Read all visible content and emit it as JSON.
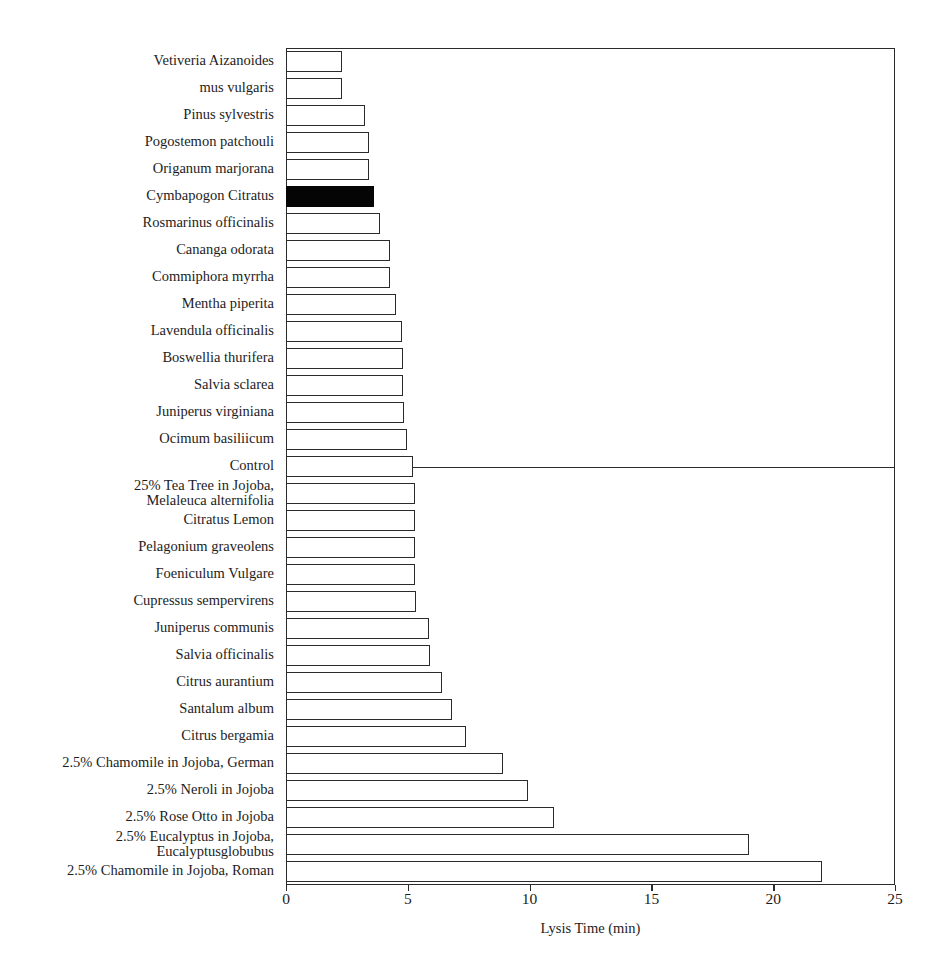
{
  "figure": {
    "top_sliver_text": "",
    "background": "#ffffff",
    "bar_outline_color": "#2b2b2b",
    "bar_fill_color": "#ffffff",
    "highlight_fill_color": "#050505"
  },
  "chart_data": {
    "type": "bar",
    "orientation": "horizontal",
    "title": "",
    "xlabel": "Lysis Time (min)",
    "ylabel": "",
    "xlim": [
      0,
      25
    ],
    "xticks": [
      0,
      5,
      10,
      15,
      20,
      25
    ],
    "xtick_labels": [
      "0",
      "5",
      "10",
      "15",
      "20",
      "25"
    ],
    "grid": false,
    "legend": null,
    "highlight_category": "Cymbapogon Citratus",
    "reference_line": {
      "category": "Control",
      "value": 5.2,
      "description": "horizontal line drawn from the Control bar tip to the right plot edge"
    },
    "categories": [
      "Vetiveria Aizanoides",
      "mus vulgaris",
      "Pinus sylvestris",
      "Pogostemon patchouli",
      "Origanum marjorana",
      "Cymbapogon Citratus",
      "Rosmarinus officinalis",
      "Cananga odorata",
      "Commiphora myrrha",
      "Mentha piperita",
      "Lavendula officinalis",
      "Boswellia thurifera",
      "Salvia sclarea",
      "Juniperus virginiana",
      "Ocimum basiliicum",
      "Control",
      "25% Tea Tree in Jojoba, Melaleuca alternifolia",
      "Citratus Lemon",
      "Pelagonium graveolens",
      "Foeniculum Vulgare",
      "Cupressus sempervirens",
      "Juniperus communis",
      "Salvia officinalis",
      "Citrus aurantium",
      "Santalum album",
      "Citrus bergamia",
      "2.5% Chamomile in Jojoba, German",
      "2.5% Neroli in Jojoba",
      "2.5% Rose Otto in Jojoba",
      "2.5% Eucalyptus in Jojoba, Eucalyptusglobubus",
      "2.5% Chamomile in Jojoba, Roman"
    ],
    "values": [
      2.3,
      2.3,
      3.25,
      3.4,
      3.4,
      3.6,
      3.85,
      4.25,
      4.25,
      4.5,
      4.75,
      4.8,
      4.8,
      4.85,
      4.95,
      5.2,
      5.3,
      5.3,
      5.3,
      5.3,
      5.35,
      5.85,
      5.9,
      6.4,
      6.8,
      7.4,
      8.9,
      9.95,
      11.0,
      19.0,
      22.0
    ]
  },
  "ylabel_lines": [
    [
      "Vetiveria Aizanoides"
    ],
    [
      "mus vulgaris"
    ],
    [
      "Pinus sylvestris"
    ],
    [
      "Pogostemon patchouli"
    ],
    [
      "Origanum marjorana"
    ],
    [
      "Cymbapogon Citratus"
    ],
    [
      "Rosmarinus officinalis"
    ],
    [
      "Cananga odorata"
    ],
    [
      "Commiphora myrrha"
    ],
    [
      "Mentha piperita"
    ],
    [
      "Lavendula officinalis"
    ],
    [
      "Boswellia thurifera"
    ],
    [
      "Salvia sclarea"
    ],
    [
      "Juniperus virginiana"
    ],
    [
      "Ocimum basiliicum"
    ],
    [
      "Control"
    ],
    [
      "25% Tea Tree in Jojoba,",
      "Melaleuca alternifolia"
    ],
    [
      "Citratus Lemon"
    ],
    [
      "Pelagonium graveolens"
    ],
    [
      "Foeniculum Vulgare"
    ],
    [
      "Cupressus sempervirens"
    ],
    [
      "Juniperus communis"
    ],
    [
      "Salvia officinalis"
    ],
    [
      "Citrus aurantium"
    ],
    [
      "Santalum album"
    ],
    [
      "Citrus bergamia"
    ],
    [
      "2.5% Chamomile in Jojoba, German"
    ],
    [
      "2.5% Neroli in Jojoba"
    ],
    [
      "2.5% Rose Otto in Jojoba"
    ],
    [
      "2.5% Eucalyptus in Jojoba,",
      "Eucalyptusglobubus"
    ],
    [
      "2.5% Chamomile in Jojoba, Roman"
    ]
  ]
}
